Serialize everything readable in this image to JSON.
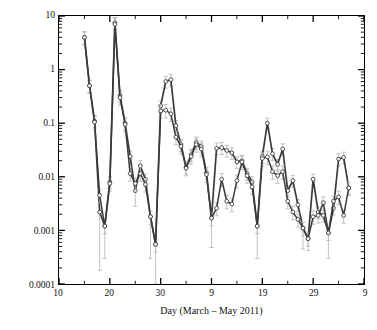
{
  "chart_data": {
    "type": "line",
    "title": "",
    "xlabel": "Day (March – May 2011)",
    "ylabel": "137Cs activity concentrations in surface air (Bq m-3)",
    "ylabel_prefix_sup": "137",
    "ylabel_main": "Cs activity concentrations in surface air (Bq m",
    "ylabel_suffix_sup": "−3",
    "ylabel_suffix_tail": ")",
    "yscale": "log",
    "ylim": [
      0.0001,
      10
    ],
    "ytick_values": [
      10,
      1,
      0.1,
      0.01,
      0.001,
      0.0001
    ],
    "ytick_labels": [
      "10",
      "1",
      "0.1",
      "0.01",
      "0.001",
      "0.0001"
    ],
    "y_minor_ticks": true,
    "grid": false,
    "legend": "none",
    "xlim": [
      0,
      60
    ],
    "xtick_positions": [
      0,
      10,
      20,
      30,
      40,
      50,
      60
    ],
    "xtick_labels": [
      "10",
      "20",
      "30",
      "9",
      "19",
      "29",
      "9"
    ],
    "x_note": "x is days elapsed from 10 March 2011; tick labels are day-of-month across March, April and May 2011",
    "marker": "open-circle",
    "line_color": "#3a3a3a",
    "marker_edge_color": "#3a3a3a",
    "marker_face_color": "#ffffff",
    "errorbar_color": "#b4b4b4",
    "series": [
      {
        "name": "series-1",
        "x": [
          5,
          6,
          7,
          8,
          9,
          10,
          11,
          12,
          13,
          14,
          15,
          16,
          17,
          18,
          19,
          20,
          21,
          22,
          23,
          24,
          25,
          26,
          27,
          28,
          29,
          30,
          31,
          32,
          33,
          34,
          35,
          36,
          37,
          38,
          39,
          40,
          41,
          42,
          43,
          44,
          45,
          46,
          47,
          48,
          49,
          50,
          51,
          52,
          53,
          54,
          55,
          56,
          57
        ],
        "y": [
          4.0,
          0.5,
          0.11,
          0.0022,
          0.0012,
          0.008,
          7.5,
          0.33,
          0.1,
          0.024,
          0.0055,
          0.016,
          0.009,
          0.0018,
          0.00055,
          0.21,
          0.6,
          0.65,
          0.09,
          0.04,
          0.015,
          0.026,
          0.044,
          0.037,
          0.012,
          0.0017,
          0.034,
          0.035,
          0.031,
          0.028,
          0.019,
          0.02,
          0.0115,
          0.008,
          0.0012,
          0.024,
          0.1,
          0.027,
          0.017,
          0.033,
          0.0055,
          0.0085,
          0.003,
          0.0011,
          0.0007,
          0.009,
          0.0022,
          0.0019,
          0.0009,
          0.0026,
          0.0215,
          0.023,
          0.0062
        ],
        "yerr_lower": [
          null,
          null,
          null,
          0.00018,
          0.0003,
          null,
          null,
          null,
          null,
          null,
          0.0028,
          null,
          null,
          0.0003,
          0.0001,
          null,
          null,
          null,
          null,
          null,
          null,
          null,
          null,
          null,
          null,
          0.00048,
          null,
          null,
          null,
          null,
          null,
          null,
          null,
          null,
          0.0003,
          null,
          null,
          null,
          null,
          null,
          null,
          null,
          null,
          0.00045,
          0.00042,
          null,
          null,
          null,
          0.0003,
          null,
          null,
          null,
          0.0047
        ]
      },
      {
        "name": "series-2",
        "x": [
          5,
          6,
          7,
          8,
          9,
          10,
          11,
          12,
          13,
          14,
          15,
          16,
          17,
          18,
          19,
          20,
          21,
          22,
          23,
          24,
          25,
          26,
          27,
          28,
          29,
          30,
          31,
          32,
          33,
          34,
          35,
          36,
          37,
          38,
          39,
          40,
          41,
          42,
          43,
          44,
          45,
          46,
          47,
          48,
          49,
          50,
          51,
          52,
          53,
          54,
          55,
          56,
          57
        ],
        "y": [
          4.0,
          0.5,
          0.105,
          0.0045,
          0.0012,
          0.0075,
          7.0,
          0.3,
          0.095,
          0.0115,
          0.0075,
          0.0115,
          0.0072,
          0.0018,
          0.00055,
          0.17,
          0.175,
          0.15,
          0.055,
          0.037,
          0.0145,
          0.024,
          0.04,
          0.033,
          0.011,
          0.0017,
          0.0026,
          0.009,
          0.0035,
          0.0031,
          0.0085,
          0.019,
          0.0105,
          0.0065,
          0.0012,
          0.022,
          0.0235,
          0.0125,
          0.0105,
          0.0125,
          0.0035,
          0.0022,
          0.0016,
          0.0011,
          0.0007,
          0.0018,
          0.0019,
          0.0033,
          0.0009,
          0.0035,
          0.0042,
          0.0019,
          0.0062
        ],
        "yerr_frac": 0.28
      }
    ]
  },
  "axes": {
    "y_ticks": [
      {
        "label": "10",
        "value": 10
      },
      {
        "label": "1",
        "value": 1
      },
      {
        "label": "0.1",
        "value": 0.1
      },
      {
        "label": "0.01",
        "value": 0.01
      },
      {
        "label": "0.001",
        "value": 0.001
      },
      {
        "label": "0.0001",
        "value": 0.0001
      }
    ],
    "x_ticks": [
      {
        "label": "10",
        "pos": 0
      },
      {
        "label": "20",
        "pos": 10
      },
      {
        "label": "30",
        "pos": 20
      },
      {
        "label": "9",
        "pos": 30
      },
      {
        "label": "19",
        "pos": 40
      },
      {
        "label": "29",
        "pos": 50
      },
      {
        "label": "9",
        "pos": 60
      }
    ]
  },
  "colors": {
    "line": "#3a3a3a",
    "error": "#b4b4b4",
    "frame": "#000000",
    "background": "#ffffff"
  }
}
